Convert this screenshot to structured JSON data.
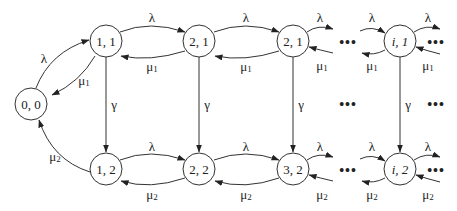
{
  "diagram": {
    "type": "state-transition-diagram",
    "nodes": [
      {
        "id": "n00",
        "label": "0, 0"
      },
      {
        "id": "n11",
        "label": "1, 1"
      },
      {
        "id": "n21",
        "label": "2, 1"
      },
      {
        "id": "n31",
        "label": "2, 1"
      },
      {
        "id": "ni1",
        "label": "i, 1"
      },
      {
        "id": "n12",
        "label": "1, 2"
      },
      {
        "id": "n22",
        "label": "2, 2"
      },
      {
        "id": "n32",
        "label": "3, 2"
      },
      {
        "id": "ni2",
        "label": "i, 2"
      }
    ],
    "rates": {
      "lambda": "λ",
      "mu": "μ",
      "sub1": "1",
      "sub2": "2",
      "gamma": "γ"
    },
    "ellipsis": "•••",
    "edges": [
      {
        "from": "0, 0",
        "to": "1, 1",
        "label": "λ"
      },
      {
        "from": "1, 1",
        "to": "0, 0",
        "label": "μ1"
      },
      {
        "from": "1, 2",
        "to": "0, 0",
        "label": "μ2"
      },
      {
        "from": "1, 1",
        "to": "2, 1",
        "label": "λ"
      },
      {
        "from": "2, 1",
        "to": "1, 1",
        "label": "μ1"
      },
      {
        "from": "2, 1",
        "to": "2, 1 (third)",
        "label": "λ"
      },
      {
        "from": "2, 1 (third)",
        "to": "2, 1",
        "label": "μ1"
      },
      {
        "from": "1, 2",
        "to": "2, 2",
        "label": "λ"
      },
      {
        "from": "2, 2",
        "to": "1, 2",
        "label": "μ2"
      },
      {
        "from": "2, 2",
        "to": "3, 2",
        "label": "λ"
      },
      {
        "from": "3, 2",
        "to": "2, 2",
        "label": "μ2"
      },
      {
        "from": "1, 1",
        "to": "1, 2",
        "label": "γ"
      },
      {
        "from": "2, 1",
        "to": "2, 2",
        "label": "γ"
      },
      {
        "from": "2, 1 (third)",
        "to": "3, 2",
        "label": "γ"
      },
      {
        "from": "i, 1",
        "to": "i, 2",
        "label": "γ"
      }
    ]
  }
}
